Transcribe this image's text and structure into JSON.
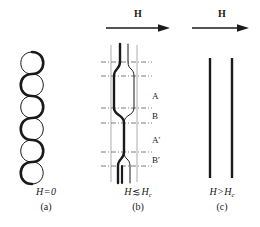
{
  "figure": {
    "background_color": "#ffffff",
    "ink_color": "#1a1a1a",
    "panels": [
      {
        "id": "a",
        "caption_letter": "(a)",
        "field_condition": "H = 0",
        "field_condition_symbol": "H",
        "field_condition_relation": "=",
        "field_condition_value": "0",
        "has_field_arrow": false,
        "shape": "double-helix",
        "turns": 6
      },
      {
        "id": "b",
        "caption_letter": "(b)",
        "field_condition": "H ≲ Hc",
        "field_condition_symbol": "H",
        "field_condition_relation": "≲",
        "field_condition_value": "H",
        "field_condition_subscript": "c",
        "has_field_arrow": true,
        "field_arrow_label": "H",
        "field_arrow_direction": "right",
        "shape": "stretched-loops-with-crossings",
        "loops": 2,
        "crossings": 3,
        "region_labels": [
          "A",
          "B",
          "A′",
          "B′"
        ],
        "guideline_style": "dash-dot",
        "guideline_count": 6
      },
      {
        "id": "c",
        "caption_letter": "(c)",
        "field_condition": "H > Hc",
        "field_condition_symbol": "H",
        "field_condition_relation": ">",
        "field_condition_value": "H",
        "field_condition_subscript": "c",
        "has_field_arrow": true,
        "field_arrow_label": "H",
        "field_arrow_direction": "right",
        "shape": "two-parallel-straight-lines",
        "line_count": 2
      }
    ]
  },
  "panel_a": {
    "caption_formula_symbol": "H",
    "caption_formula_relation": "=",
    "caption_formula_value": "0",
    "caption_letter": "(a)"
  },
  "panel_b": {
    "field_label": "H",
    "caption_formula_symbol": "H",
    "caption_formula_relation": "≲",
    "caption_formula_value": "H",
    "caption_formula_subscript": "c",
    "caption_letter": "(b)",
    "regions": [
      {
        "label": "A",
        "y": 97
      },
      {
        "label": "B",
        "y": 117
      },
      {
        "label": "A′",
        "y": 140
      },
      {
        "label": "B′",
        "y": 160
      }
    ]
  },
  "panel_c": {
    "field_label": "H",
    "caption_formula_symbol": "H",
    "caption_formula_relation": ">",
    "caption_formula_value": "H",
    "caption_formula_subscript": "c",
    "caption_letter": "(c)"
  }
}
